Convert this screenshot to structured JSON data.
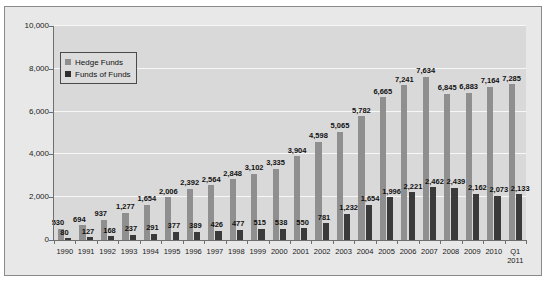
{
  "chart_data": {
    "type": "bar",
    "title": "",
    "subtitle": "",
    "xlabel": "",
    "ylabel": "",
    "ylim": [
      0,
      10000
    ],
    "ytick_labels": [
      "0",
      "2,000",
      "4,000",
      "6,000",
      "8,000",
      "10,000"
    ],
    "ytick_values": [
      0,
      2000,
      4000,
      6000,
      8000,
      10000
    ],
    "grid": true,
    "grid_axis": "y",
    "legend_position": "upper-left",
    "categories": [
      "1990",
      "1991",
      "1992",
      "1993",
      "1994",
      "1995",
      "1996",
      "1997",
      "1998",
      "1999",
      "2000",
      "2001",
      "2002",
      "2003",
      "2004",
      "2005",
      "2006",
      "2007",
      "2008",
      "2009",
      "2010",
      "Q1\n2011"
    ],
    "series": [
      {
        "name": "Hedge Funds",
        "color": "#8f8f8f",
        "values": [
          530,
          694,
          937,
          1277,
          1654,
          2006,
          2392,
          2564,
          2848,
          3102,
          3335,
          3904,
          4598,
          5065,
          5782,
          6665,
          7241,
          7634,
          6845,
          6883,
          7164,
          7285
        ],
        "labels": [
          "530",
          "694",
          "937",
          "1,277",
          "1,654",
          "2,006",
          "2,392",
          "2,564",
          "2,848",
          "3,102",
          "3,335",
          "3,904",
          "4,598",
          "5,065",
          "5,782",
          "6,665",
          "7,241",
          "7,634",
          "6,845",
          "6,883",
          "7,164",
          "7,285"
        ]
      },
      {
        "name": "Funds of Funds",
        "color": "#3a3a3a",
        "values": [
          80,
          127,
          168,
          237,
          291,
          377,
          389,
          426,
          477,
          515,
          538,
          550,
          781,
          1232,
          1654,
          1996,
          2221,
          2462,
          2439,
          2162,
          2073,
          2133
        ],
        "labels": [
          "80",
          "127",
          "168",
          "237",
          "291",
          "377",
          "389",
          "426",
          "477",
          "515",
          "538",
          "550",
          "781",
          "1,232",
          "1,654",
          "1,996",
          "2,221",
          "2,462",
          "2,439",
          "2,162",
          "2,073",
          "2,133"
        ]
      }
    ]
  },
  "legend": {
    "items": [
      {
        "label": "Hedge Funds"
      },
      {
        "label": "Funds of Funds"
      }
    ]
  }
}
